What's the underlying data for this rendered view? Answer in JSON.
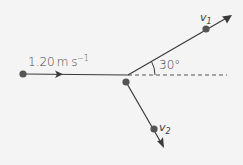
{
  "diagram": {
    "type": "collision-vector-diagram",
    "colors": {
      "background": "#f4f4f4",
      "line": "#3a3a3a",
      "dot": "#555555",
      "dashed": "#555555",
      "text": "#444444"
    },
    "labels": {
      "initial_velocity_value": "1.20",
      "initial_velocity_unit": "m s",
      "initial_velocity_exp": "−1",
      "angle": "30°",
      "v1_base": "v",
      "v1_sub": "1",
      "v2_base": "v",
      "v2_sub": "2"
    },
    "points": {
      "start_dot": [
        23,
        74
      ],
      "junction": [
        128,
        75
      ],
      "lower_dot": [
        126,
        82
      ],
      "v1_dot": [
        206,
        29
      ],
      "v1_arrow_tip": [
        232,
        15
      ],
      "v2_dot": [
        154,
        129
      ],
      "v2_arrow_tip": [
        164,
        148
      ],
      "dashed_end": [
        227,
        75
      ],
      "mid_arrow": [
        61,
        74
      ]
    }
  }
}
